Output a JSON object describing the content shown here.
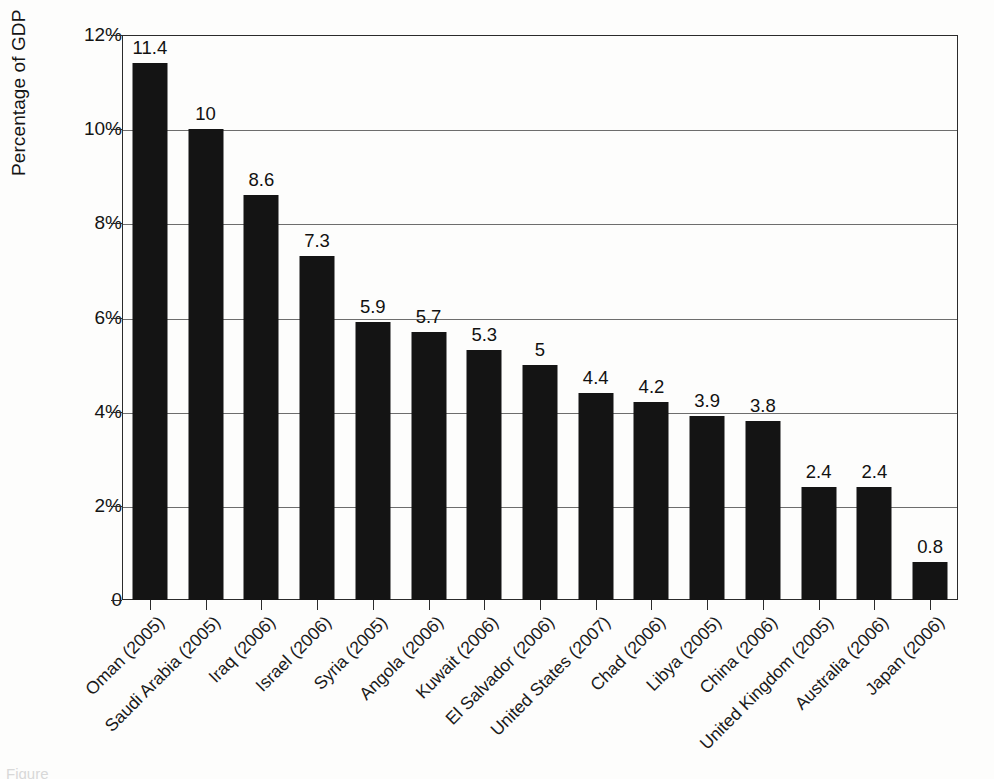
{
  "figure": {
    "background_color": "#fdfdfc",
    "bar_color": "#141414",
    "axis_color": "#2b2b2b",
    "gridline_color": "#6d6d6d",
    "caption_partial": "Figure"
  },
  "axes": {
    "y_title": "Percentage of GDP",
    "y_ticks": [
      "12%",
      "10%",
      "8%",
      "6%",
      "4%",
      "2%",
      "0"
    ],
    "y_tick_values": [
      12,
      10,
      8,
      6,
      4,
      2,
      0
    ],
    "y_min": 0,
    "y_max": 12,
    "x_title": ""
  },
  "chart_data": {
    "type": "bar",
    "title": "",
    "subtitle": "",
    "xlabel": "",
    "ylabel": "Percentage of GDP",
    "ylim": [
      0,
      12
    ],
    "ytick_labels": [
      "0",
      "2%",
      "4%",
      "6%",
      "8%",
      "10%",
      "12%"
    ],
    "grid": true,
    "legend": false,
    "legend_position": "none",
    "value_labels_shown": true,
    "categories": [
      "Oman (2005)",
      "Saudi Arabia (2005)",
      "Iraq (2006)",
      "Israel (2006)",
      "Syria (2005)",
      "Angola (2006)",
      "Kuwait (2006)",
      "El Salvador (2006)",
      "United States (2007)",
      "Chad (2006)",
      "Libya (2005)",
      "China (2006)",
      "United Kingdom (2005)",
      "Australia (2006)",
      "Japan (2006)"
    ],
    "values": [
      11.4,
      10,
      8.6,
      7.3,
      5.9,
      5.7,
      5.3,
      5,
      4.4,
      4.2,
      3.9,
      3.8,
      2.4,
      2.4,
      0.8
    ],
    "value_label_texts": [
      "11.4",
      "10",
      "8.6",
      "7.3",
      "5.9",
      "5.7",
      "5.3",
      "5",
      "4.4",
      "4.2",
      "3.9",
      "3.8",
      "2.4",
      "2.4",
      "0.8"
    ]
  }
}
